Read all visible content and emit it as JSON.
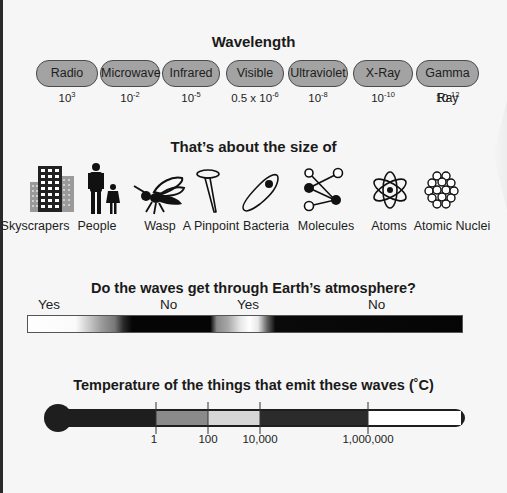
{
  "wavelength": {
    "title": "Wavelength",
    "bands": [
      {
        "name": "Radio",
        "base": "10",
        "exp": "3",
        "prefix": ""
      },
      {
        "name": "Microwave",
        "base": "10",
        "exp": "-2",
        "prefix": ""
      },
      {
        "name": "Infrared",
        "base": "10",
        "exp": "-5",
        "prefix": ""
      },
      {
        "name": "Visible",
        "base": "10",
        "exp": "-6",
        "prefix": "0.5 x "
      },
      {
        "name": "Ultraviolet",
        "base": "10",
        "exp": "-8",
        "prefix": ""
      },
      {
        "name": "X-Ray",
        "base": "10",
        "exp": "-10",
        "prefix": ""
      },
      {
        "name": "Gamma Ray",
        "base": "10",
        "exp": "-12",
        "prefix": ""
      }
    ]
  },
  "size": {
    "title": "That’s about the size of",
    "items": [
      {
        "label": "Skyscrapers",
        "icon": "skyscrapers-icon"
      },
      {
        "label": "People",
        "icon": "people-icon"
      },
      {
        "label": "Wasp",
        "icon": "wasp-icon"
      },
      {
        "label": "A Pinpoint",
        "icon": "pinpoint-icon"
      },
      {
        "label": "Bacteria",
        "icon": "bacteria-icon"
      },
      {
        "label": "Molecules",
        "icon": "molecules-icon"
      },
      {
        "label": "Atoms",
        "icon": "atom-icon"
      },
      {
        "label": "Atomic Nuclei",
        "icon": "atomic-nucleus-icon"
      }
    ]
  },
  "atmosphere": {
    "title": "Do the waves get through Earth’s atmosphere?",
    "labels": [
      "Yes",
      "No",
      "Yes",
      "No"
    ]
  },
  "temperature": {
    "title": "Temperature of the things that emit these waves (˚C)",
    "ticks": [
      "1",
      "100",
      "10,000",
      "1,000,000"
    ]
  },
  "colors": {
    "background": "#f6f6f6",
    "pill_fill": "#a3a3a3",
    "pill_border": "#4a4a4a",
    "thermo_dark": "#1e1e1e",
    "thermo_mid": "#8a8a8a",
    "thermo_light": "#d6d6d6",
    "thermo_white": "#ffffff"
  }
}
